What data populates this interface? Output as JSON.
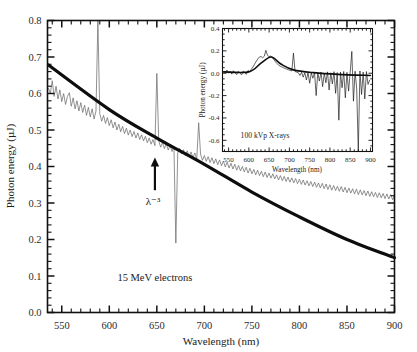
{
  "figure": {
    "background_color": "#ffffff",
    "spectrum_color": "#6e6e6e",
    "fit_color": "#0d0d0d",
    "axis_color": "#111111"
  },
  "chart_data": [
    {
      "id": "main",
      "type": "line",
      "title": "",
      "xlabel": "Wavelength (nm)",
      "ylabel": "Photon energy (µJ)",
      "xlim": [
        535,
        900
      ],
      "ylim": [
        0.0,
        0.8
      ],
      "xticks": [
        550,
        600,
        650,
        700,
        750,
        800,
        850,
        900
      ],
      "xtick_labels": [
        "550",
        "600",
        "650",
        "700",
        "750",
        "800",
        "850",
        "900"
      ],
      "yticks": [
        0.0,
        0.1,
        0.2,
        0.3,
        0.4,
        0.5,
        0.6,
        0.7,
        0.8
      ],
      "ytick_labels": [
        "0.0",
        "0.1",
        "0.2",
        "0.3",
        "0.4",
        "0.5",
        "0.6",
        "0.7",
        "0.8"
      ],
      "minor_ticks": true,
      "grid": false,
      "legend": "none",
      "annotations": [
        {
          "name": "sample-label",
          "text": "15 MeV electrons",
          "x": 648,
          "y": 0.085
        },
        {
          "name": "power-law-label",
          "text": "λ⁻³",
          "x": 646,
          "y": 0.295
        }
      ],
      "arrow": {
        "name": "power-law-arrow",
        "x": 648,
        "y_tail": 0.335,
        "y_head": 0.425
      },
      "series": [
        {
          "name": "Measured spectrum (15 MeV electrons)",
          "style": "noisy-line",
          "color": "#6e6e6e",
          "x": [
            536,
            538,
            540,
            542,
            544,
            546,
            548,
            550,
            552,
            554,
            556,
            558,
            560,
            562,
            564,
            566,
            568,
            570,
            572,
            574,
            576,
            578,
            580,
            582,
            584,
            586,
            588,
            590,
            592,
            594,
            596,
            598,
            600,
            602,
            604,
            606,
            608,
            610,
            612,
            614,
            616,
            618,
            620,
            622,
            624,
            626,
            628,
            630,
            632,
            634,
            636,
            638,
            640,
            642,
            644,
            646,
            648,
            650,
            652,
            654,
            656,
            658,
            660,
            662,
            664,
            666,
            668,
            670,
            672,
            674,
            676,
            678,
            680,
            682,
            684,
            686,
            688,
            690,
            692,
            694,
            696,
            698,
            700,
            702,
            704,
            706,
            708,
            710,
            712,
            714,
            716,
            718,
            720,
            722,
            724,
            726,
            728,
            730,
            732,
            734,
            736,
            738,
            740,
            742,
            744,
            746,
            748,
            750,
            752,
            754,
            756,
            758,
            760,
            762,
            764,
            766,
            768,
            770,
            772,
            774,
            776,
            778,
            780,
            782,
            784,
            786,
            788,
            790,
            792,
            794,
            796,
            798,
            800,
            802,
            804,
            806,
            808,
            810,
            812,
            814,
            816,
            818,
            820,
            822,
            824,
            826,
            828,
            830,
            832,
            834,
            836,
            838,
            840,
            842,
            844,
            846,
            848,
            850,
            852,
            854,
            856,
            858,
            860,
            862,
            864,
            866,
            868,
            870,
            872,
            874,
            876,
            878,
            880,
            882,
            884,
            886,
            888,
            890,
            892,
            894,
            896,
            898,
            900
          ],
          "y": [
            0.615,
            0.6,
            0.635,
            0.592,
            0.62,
            0.585,
            0.61,
            0.578,
            0.6,
            0.57,
            0.592,
            0.602,
            0.565,
            0.588,
            0.558,
            0.58,
            0.552,
            0.575,
            0.548,
            0.568,
            0.54,
            0.562,
            0.536,
            0.558,
            0.53,
            0.552,
            0.8,
            0.545,
            0.524,
            0.54,
            0.518,
            0.534,
            0.512,
            0.528,
            0.506,
            0.522,
            0.5,
            0.516,
            0.495,
            0.51,
            0.49,
            0.505,
            0.486,
            0.5,
            0.482,
            0.496,
            0.478,
            0.492,
            0.474,
            0.487,
            0.47,
            0.483,
            0.465,
            0.478,
            0.461,
            0.474,
            0.457,
            0.655,
            0.47,
            0.453,
            0.466,
            0.449,
            0.462,
            0.445,
            0.458,
            0.441,
            0.454,
            0.19,
            0.437,
            0.45,
            0.434,
            0.446,
            0.43,
            0.443,
            0.427,
            0.44,
            0.424,
            0.437,
            0.42,
            0.52,
            0.434,
            0.417,
            0.43,
            0.414,
            0.427,
            0.411,
            0.424,
            0.408,
            0.421,
            0.405,
            0.418,
            0.402,
            0.415,
            0.399,
            0.412,
            0.396,
            0.409,
            0.393,
            0.406,
            0.39,
            0.403,
            0.388,
            0.4,
            0.385,
            0.398,
            0.382,
            0.395,
            0.38,
            0.392,
            0.377,
            0.39,
            0.375,
            0.387,
            0.372,
            0.385,
            0.37,
            0.382,
            0.368,
            0.38,
            0.366,
            0.377,
            0.363,
            0.375,
            0.361,
            0.373,
            0.359,
            0.371,
            0.357,
            0.369,
            0.355,
            0.367,
            0.353,
            0.365,
            0.351,
            0.363,
            0.349,
            0.361,
            0.347,
            0.359,
            0.345,
            0.357,
            0.343,
            0.355,
            0.341,
            0.354,
            0.339,
            0.352,
            0.337,
            0.35,
            0.335,
            0.348,
            0.334,
            0.346,
            0.332,
            0.345,
            0.33,
            0.343,
            0.328,
            0.341,
            0.327,
            0.339,
            0.325,
            0.338,
            0.323,
            0.336,
            0.322,
            0.334,
            0.32,
            0.333,
            0.318,
            0.331,
            0.317,
            0.329,
            0.315,
            0.328,
            0.314,
            0.326,
            0.312,
            0.325,
            0.311,
            0.323,
            0.309,
            0.322,
            0.308,
            0.32,
            0.318
          ]
        },
        {
          "name": "Lambda^-3 fit",
          "style": "smooth-thick",
          "color": "#0d0d0d",
          "description": "power law proportional to wavelength^-3",
          "anchor_points": [
            {
              "x": 536,
              "y": 0.678
            },
            {
              "x": 600,
              "y": 0.556
            },
            {
              "x": 650,
              "y": 0.478
            },
            {
              "x": 700,
              "y": 0.406
            },
            {
              "x": 750,
              "y": 0.33
            },
            {
              "x": 800,
              "y": 0.262
            },
            {
              "x": 850,
              "y": 0.2
            },
            {
              "x": 900,
              "y": 0.15
            }
          ]
        }
      ]
    },
    {
      "id": "inset",
      "type": "line",
      "title": "",
      "xlabel": "Wavelength (nm)",
      "ylabel": "Photon energy (µJ)",
      "xlim": [
        535,
        905
      ],
      "ylim": [
        -0.7,
        0.4
      ],
      "xticks": [
        550,
        600,
        650,
        700,
        750,
        800,
        850,
        900
      ],
      "xtick_labels": [
        "550",
        "600",
        "650",
        "700",
        "750",
        "800",
        "850",
        "900"
      ],
      "yticks": [
        0.4,
        0.2,
        0.0,
        -0.2,
        -0.4,
        -0.6
      ],
      "ytick_labels": [
        "0.4",
        "0.2",
        "0.0",
        "-0.2",
        "-0.4",
        "-0.6"
      ],
      "minor_ticks": true,
      "grid": false,
      "legend": "none",
      "annotations": [
        {
          "name": "inset-sample-label",
          "text": "100 kVp X-rays",
          "x": 640,
          "y": -0.58
        }
      ],
      "series": [
        {
          "name": "Measured spectrum (100 kVp X-rays)",
          "style": "noisy-line",
          "color": "#111111",
          "x": [
            538,
            542,
            546,
            550,
            554,
            558,
            562,
            566,
            570,
            574,
            578,
            582,
            586,
            590,
            594,
            598,
            602,
            606,
            610,
            614,
            618,
            622,
            626,
            630,
            634,
            638,
            642,
            646,
            650,
            654,
            658,
            662,
            666,
            670,
            674,
            678,
            682,
            686,
            690,
            694,
            698,
            702,
            706,
            710,
            714,
            718,
            722,
            726,
            730,
            734,
            738,
            742,
            746,
            750,
            754,
            758,
            762,
            766,
            770,
            774,
            778,
            782,
            786,
            790,
            794,
            798,
            802,
            806,
            810,
            814,
            818,
            822,
            826,
            830,
            834,
            838,
            842,
            846,
            850,
            854,
            858,
            862,
            866,
            870,
            874,
            878,
            882,
            886,
            890,
            894,
            898,
            902
          ],
          "y": [
            0.02,
            0.005,
            0.028,
            0.0,
            0.018,
            -0.008,
            0.022,
            0.004,
            -0.012,
            0.018,
            0.002,
            -0.015,
            0.02,
            0.006,
            -0.01,
            0.025,
            0.012,
            0.035,
            0.055,
            0.08,
            0.105,
            0.128,
            0.145,
            0.15,
            0.138,
            0.152,
            0.205,
            0.16,
            0.148,
            0.155,
            0.14,
            0.12,
            0.1,
            0.085,
            0.07,
            0.062,
            0.055,
            0.048,
            0.042,
            0.036,
            0.03,
            0.025,
            0.02,
            0.18,
            0.015,
            0.01,
            0.005,
            -0.02,
            0.008,
            -0.035,
            0.004,
            -0.06,
            0.006,
            -0.09,
            0.002,
            -0.045,
            0.008,
            -0.2,
            0.004,
            -0.07,
            0.01,
            -0.12,
            0.002,
            -0.085,
            0.012,
            -0.15,
            0.004,
            -0.095,
            0.014,
            -0.18,
            0.006,
            -0.42,
            0.01,
            -0.13,
            0.016,
            -0.22,
            0.008,
            -0.16,
            0.012,
            0.195,
            -0.25,
            0.018,
            -0.14,
            -0.7,
            0.02,
            -0.19,
            0.01,
            -0.23,
            0.015,
            -0.1,
            -0.06
          ]
        },
        {
          "name": "Smoothed baseline",
          "style": "smooth-thick",
          "color": "#0d0d0d",
          "anchor_points": [
            {
              "x": 538,
              "y": 0.012
            },
            {
              "x": 600,
              "y": 0.012
            },
            {
              "x": 630,
              "y": 0.09
            },
            {
              "x": 655,
              "y": 0.145
            },
            {
              "x": 680,
              "y": 0.08
            },
            {
              "x": 710,
              "y": 0.03
            },
            {
              "x": 760,
              "y": 0.005
            },
            {
              "x": 820,
              "y": -0.01
            },
            {
              "x": 900,
              "y": -0.02
            }
          ]
        }
      ]
    }
  ]
}
